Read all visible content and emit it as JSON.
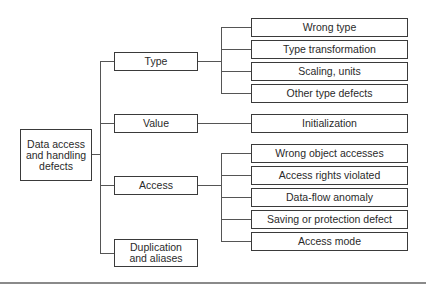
{
  "diagram": {
    "type": "tree",
    "root": {
      "label": "Data access and handling defects"
    },
    "categories": [
      {
        "label": "Type",
        "children": [
          "Wrong type",
          "Type transformation",
          "Scaling, units",
          "Other type defects"
        ]
      },
      {
        "label": "Value",
        "children": [
          "Initialization"
        ]
      },
      {
        "label": "Access",
        "children": [
          "Wrong object accesses",
          "Access rights violated",
          "Data-flow anomaly",
          "Saving or protection defect",
          "Access mode"
        ]
      },
      {
        "label": "Duplication and aliases",
        "children": []
      }
    ],
    "colors": {
      "border": "#3a3a3a",
      "line": "#555555",
      "text": "#2a2a2a",
      "background": "#ffffff"
    }
  }
}
